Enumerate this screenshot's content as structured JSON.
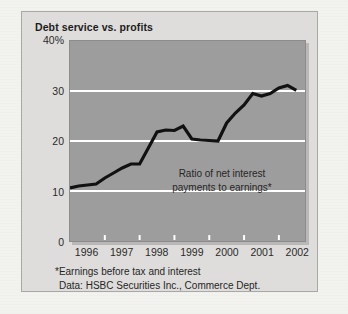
{
  "chart": {
    "title": "Debt service vs. profits",
    "annotation_line1": "Ratio of net interest",
    "annotation_line2": "payments to earnings*",
    "footnote_line1": "*Earnings before tax and interest",
    "footnote_line2": "Data: HSBC Securities Inc., Commerce Dept."
  },
  "chart_data": {
    "type": "line",
    "title": "Debt service vs. profits",
    "xlabel": "",
    "ylabel": "",
    "ylim": [
      0,
      40
    ],
    "xlim": [
      1996,
      2002.75
    ],
    "grid": true,
    "legend": false,
    "y_ticks": [
      "0",
      "10",
      "20",
      "30",
      "40%"
    ],
    "y_tick_values": [
      0,
      10,
      20,
      30,
      40
    ],
    "x_ticks": [
      "1996",
      "1997",
      "1998",
      "1999",
      "2000",
      "2001",
      "2002"
    ],
    "x_tick_values": [
      1996,
      1997,
      1998,
      1999,
      2000,
      2001,
      2002
    ],
    "annotation": "Ratio of net interest payments to earnings*",
    "source": "Data: HSBC Securities Inc., Commerce Dept.",
    "note": "*Earnings before tax and interest",
    "line_color": "#111111",
    "plot_background": "#9d9d9d",
    "gridline_color": "#ffffff",
    "series": [
      {
        "name": "Ratio of net interest payments to earnings",
        "x": [
          1996.0,
          1996.25,
          1996.5,
          1996.75,
          1997.0,
          1997.25,
          1997.5,
          1997.75,
          1998.0,
          1998.25,
          1998.5,
          1998.75,
          1999.0,
          1999.25,
          1999.5,
          1999.75,
          2000.0,
          2000.25,
          2000.5,
          2000.75,
          2001.0,
          2001.25,
          2001.5,
          2001.75,
          2002.0,
          2002.25,
          2002.5
        ],
        "values": [
          10.6,
          11.0,
          11.2,
          11.4,
          12.6,
          13.6,
          14.6,
          15.4,
          15.4,
          18.6,
          21.8,
          22.2,
          22.1,
          23.0,
          20.4,
          20.2,
          20.1,
          20.0,
          23.6,
          25.6,
          27.2,
          29.5,
          29.0,
          29.5,
          30.6,
          31.1,
          30.1
        ]
      }
    ]
  }
}
